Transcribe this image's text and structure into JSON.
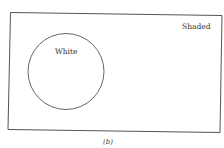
{
  "diagram": {
    "universe_label": "Shaded",
    "set_label": "White",
    "caption": "(b)"
  },
  "colors": {
    "line": "#555555",
    "background": "#ffffff"
  }
}
